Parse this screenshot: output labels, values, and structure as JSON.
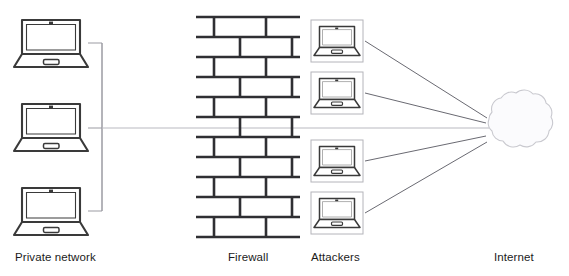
{
  "diagram": {
    "type": "network-topology",
    "background_color": "#ffffff",
    "stroke_color": "#3a3a3a",
    "line_color": "#555555",
    "cloud_fill": "#fcfcfd",
    "cloud_stroke": "#c9c9cf",
    "text_color": "#1b1b1b"
  },
  "labels": {
    "private_network": "Private network",
    "firewall": "Firewall",
    "attackers": "Attackers",
    "internet": "Internet"
  },
  "private_network": {
    "label": "Private network",
    "device_count": 3,
    "device_type": "laptop",
    "devices": [
      {
        "name": "private-laptop-1",
        "x": 14,
        "y": 18,
        "w": 74,
        "h": 50
      },
      {
        "name": "private-laptop-2",
        "x": 14,
        "y": 102,
        "w": 74,
        "h": 50
      },
      {
        "name": "private-laptop-3",
        "x": 14,
        "y": 186,
        "w": 74,
        "h": 50
      }
    ],
    "bus_x": 102,
    "bus_top": 45,
    "bus_bottom": 211
  },
  "firewall": {
    "label": "Firewall",
    "x": 196,
    "y": 16,
    "width": 104,
    "height": 222,
    "rows": 11,
    "row_height": 20,
    "pattern": "running-bond-brick"
  },
  "attackers": {
    "label": "Attackers",
    "device_count": 4,
    "device_type": "laptop",
    "devices": [
      {
        "name": "attacker-laptop-1",
        "x": 311,
        "y": 20,
        "w": 52,
        "h": 42
      },
      {
        "name": "attacker-laptop-2",
        "x": 311,
        "y": 72,
        "w": 52,
        "h": 42
      },
      {
        "name": "attacker-laptop-3",
        "x": 311,
        "y": 140,
        "w": 52,
        "h": 42
      },
      {
        "name": "attacker-laptop-4",
        "x": 311,
        "y": 192,
        "w": 52,
        "h": 42
      }
    ]
  },
  "internet": {
    "label": "Internet",
    "shape": "cloud",
    "x": 478,
    "y": 95,
    "width": 73,
    "height": 65
  },
  "connections": {
    "trunk_y": 128,
    "description": "Four attacker laptops connect by straight lines to the Internet cloud; the private network bus runs horizontally through the firewall to the cloud.",
    "links": [
      {
        "from": "private-laptop-1",
        "to": "network-bus"
      },
      {
        "from": "private-laptop-2",
        "to": "network-bus"
      },
      {
        "from": "private-laptop-3",
        "to": "network-bus"
      },
      {
        "from": "network-bus",
        "to": "internet-cloud",
        "through": "firewall"
      },
      {
        "from": "attacker-laptop-1",
        "to": "internet-cloud"
      },
      {
        "from": "attacker-laptop-2",
        "to": "internet-cloud"
      },
      {
        "from": "attacker-laptop-3",
        "to": "internet-cloud"
      },
      {
        "from": "attacker-laptop-4",
        "to": "internet-cloud"
      }
    ]
  }
}
